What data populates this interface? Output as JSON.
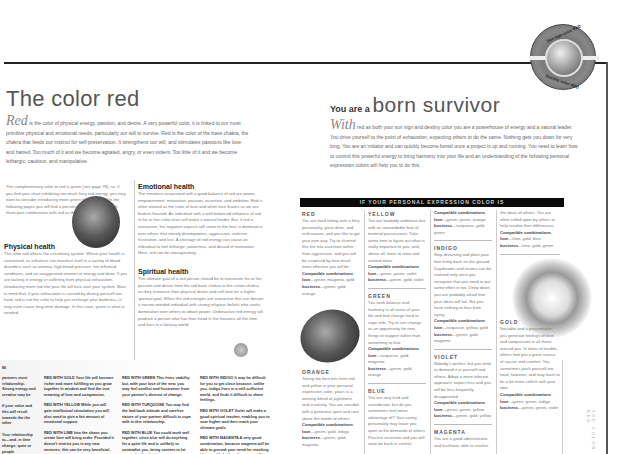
{
  "left_page": {
    "title": "The color red",
    "intro": {
      "dropcap": "Red",
      "text": " is the color of physical energy, passion, and desire. A very powerful color, it is linked to our most primitive physical and emotional needs, particularly our will to survive. Red is the color of the base chakra, the chakra that feeds our instinct for self-preservation. It strengthens our will, and stimulates passions like love and hatred. Too much of it and we become agitated, angry, or even violent. Too little of it and we become lethargic, cautious, and manipulative."
    },
    "side_note": "The complementary color to red is green (see page 78), so, if you find your chart exhibiting too much fiery red energy, you may want to consider introducing more green into your life. On the following pages you will find a personalized reading for each three-part combination with red as the sun sign.",
    "physical_health": {
      "heading": "Physical health",
      "text": "The color red affects the circulatory system. Where your health is concerned, its influence can manifest itself in a variety of blood disorders such as anemia, high blood pressure, hot inflamed conditions, and an exaggerated amount of energy and drive. If you are lacking in energy or suffering from physical exhaustion, introducing more red into your life will kick-start your system. Bear in mind that, if your exhaustion is caused by driving yourself too hard, red is not the color to help you recharge your batteries—it may even cause long-term damage. In this case, green is what is needed."
    },
    "emotional_health": {
      "heading": "Emotional health",
      "text": "The emotions associated with a good balance of red are power, empowerment, motivation, passion, assertion, and ambition. Red is often viewed as the color of love and when love leaves us we are broken-hearted. An individual with a well-balanced influence of red in his or her color chart will make a natural leader. But, if red is overactive, the negative aspects will come to the fore: a dominance over others that merely disempowers, aggression, violence, frustration, and lust. A shortage of red energy can cause an individual to feel lethargic, powerless, and devoid of motivation. Here, red can be reinvigorating."
    },
    "spiritual_health": {
      "heading": "Spiritual health",
      "text": "The ultimate goal of a red person should be to transmute his or her passion and desire from the red base chakra to the crown chakra, as they renounce their physical drives and self-love for a higher spiritual goal. When the red energies are overactive this can denote a narrow-minded individual with strong religious beliefs who seeks domination over others to obtain power. Underactive red energy will produce a person who has their head in the heavens all the time and lives in a fantasy world."
    },
    "bottom_strip": {
      "page_label": "86",
      "col0": [
        "partners must relationship. Strong energy and creative may be",
        "If your value and this will result towards the the other",
        "Your relationship to—and, in time change, quite or people"
      ],
      "col1": [
        "RED WITH GOLD Your life will become richer and more fulfilling as you grow together in wisdom and find the true meaning of love and compassion.",
        "RED WITH YELLOW While you will gain intellectual stimulation you will also need to give a fair amount of emotional support.",
        "RED WITH LIME Into the chaos you create lime will bring order. Provided it doesn't restrict you in any new ventures, this can be very beneficial."
      ],
      "col2": [
        "RED WITH GREEN This frees stability but, with your love of the new, you may feel conflict and frustration from your partner's distrust of change.",
        "RED WITH TURQUOISE You may find the laid-back attitude and carefree nature of your partner difficult to cope with in this relationship.",
        "RED WITH BLUE You could work well together, since blue will do anything for a quiet life and is unlikely to contradict you, being content to let you make the decisions."
      ],
      "col3": [
        "RED WITH INDIGO It may be difficult for you to get close because, unlike you, indigo lives in a self-sufficient world, and finds it difficult to share feelings.",
        "RED WITH VIOLET Violet will make a good spiritual teacher, enabling you to soar higher and then reach your ultimate goals.",
        "RED WITH MAGENTA A very good combination, because magenta will be able to ground your need for reaching ideas and help them become realities."
      ]
    }
  },
  "right_page": {
    "title_small": "You are a",
    "title_big": "born survivor",
    "badge": {
      "top_text": "Sun sign color RED",
      "bottom_text": "Destiny color RED"
    },
    "intro": {
      "dropcap": "With",
      "text": " red as both your sun sign and destiny color you are a powerhouse of energy and a natural leader. You drive yourself to the point of exhaustion, expecting others to do the same. Nothing gets you down for very long. You are an initiator and can quickly become bored once a project is up and running. You need to learn how to control this powerful energy to bring harmony into your life and an understanding of the following personal expression colors will help you to do this."
    },
    "banner": "IF YOUR PERSONAL EXPRESSION COLOR IS",
    "combo_label": "Compatible combinations",
    "love_label": "love",
    "business_label": "business",
    "colors": [
      {
        "name": "RED",
        "text": "You are hard-hitting with a fiery personality, great drive, and enthusiasm, and you like to get your own way. Try to channel this fire into assertion rather than aggression, and you will be surprised by how much more effective you will be.",
        "love": "—green, magenta, gold",
        "business": "—green, gold, orange"
      },
      {
        "name": "ORANGE",
        "text": "Taking the best bits from red and yellow in your personal expression color, yours is a winning blend of joyfulness and creativity. You are sociable with a generous spirit and care about the needs of others.",
        "love": "—green, gold, indigo",
        "business": "—green, gold, magenta"
      },
      {
        "name": "YELLOW",
        "text": "You are laudably ambitious but with an unavoidable love of material possessions. Take some time to figure out what is really important to you, and, above all, learn to relax and unwind more.",
        "love": "—green, green, violet",
        "business": "—green, gold, violet"
      },
      {
        "name": "GREEN",
        "text": "You seek balance and harmony in all areas of your life and find change hard to cope with. Try to see change as an opportunity for new things to happen rather than something to fear.",
        "love": "—turquoise, gold, magenta",
        "business": "—green, gold, orange"
      },
      {
        "name": "BLUE",
        "text": "You are very kind and considerate, but do you sometimes feel taken advantage of? Your caring personality may leave you open to the demands of others. Practice assertion and you will soon be back in control.",
        "love": "",
        "business": ""
      },
      {
        "name": "TURQUOISE",
        "text": "",
        "love": "—green, green, orange",
        "business": "—turquoise, gold, green"
      },
      {
        "name": "INDIGO",
        "text": "Stop dreaming and plant your feet firmly back on the ground. Daydreams and visions can be realized only once you recognize that you need to put some effort in too. Deep down you are probably afraid that your ideas will fail. But you have nothing to lose from trying.",
        "love": "—turquoise, yellow, gold",
        "business": "—green, gold, magenta"
      },
      {
        "name": "VIOLET",
        "text": "Nobody's perfect, but you tend to demand it in yourself and others. Adopt a more tolerant approach; expect less and you will be less frequently disappointed.",
        "love": "—green, green, yellow",
        "business": "—green, gold, yellow"
      },
      {
        "name": "MAGENTA",
        "text": "You are a good administrator and facilitator, able to resolve",
        "love": "",
        "business": ""
      },
      {
        "name": "LIME",
        "text": "the ideas of others. You are often called upon by others to help resolve their differences.",
        "love": "—lime, gold, blue",
        "business": "—lime, gold, green"
      },
      {
        "name": "GOLD",
        "text": "Sociable and a peacemaker, you generate feelings of love and compassion in all those around you. In times of trouble, others find you a great source of succor and comfort. You sometimes push yourself too hard, however, and may learn to be a bit more selfish with your time.",
        "love": "—green, green, indigo",
        "business": "—green, green, violet"
      }
    ],
    "vertical_tab": "THE COLOR RED"
  }
}
